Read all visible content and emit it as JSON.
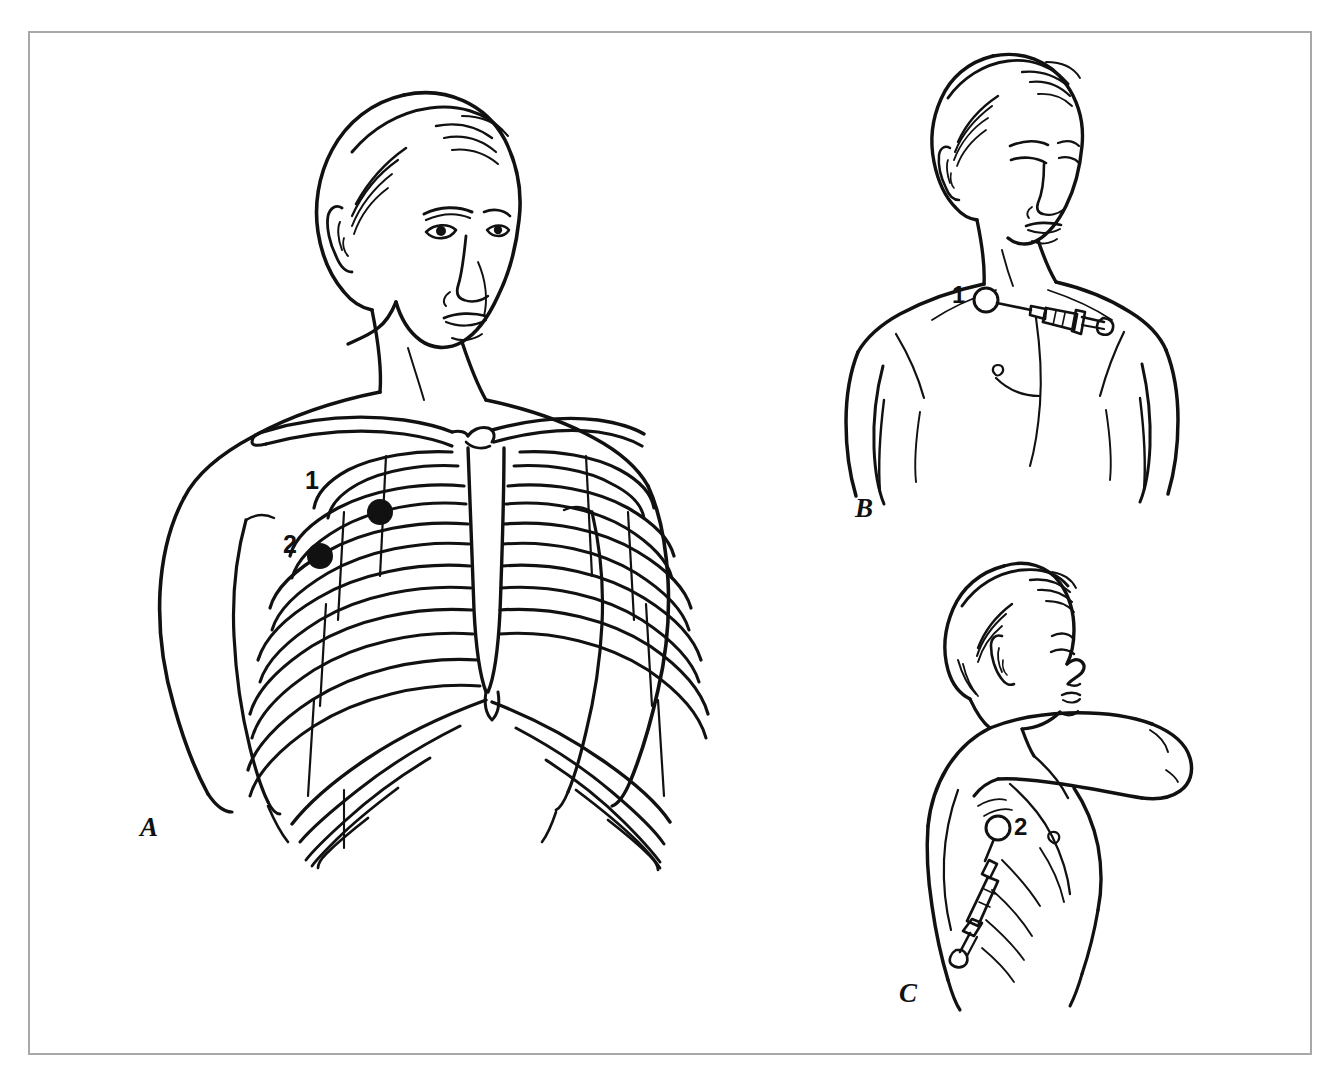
{
  "figure": {
    "background_color": "#ffffff",
    "border_color": "#a8a8a8",
    "ink_color": "#111111"
  },
  "panels": [
    {
      "id": "A",
      "letter": "A",
      "description": "Anterior view of the chest with rib cage, clavicles and sternum shown through the skin; two insertion sites marked with filled black dots on the right anterolateral chest wall.",
      "markers": [
        {
          "label": "1",
          "shape": "filled-dot",
          "description": "Upper insertion site over the anterior chest wall"
        },
        {
          "label": "2",
          "shape": "filled-dot",
          "description": "Lower lateral insertion site"
        }
      ]
    },
    {
      "id": "B",
      "letter": "B",
      "description": "Upper-body front view of the patient with head turned down; a syringe with needle is inserted horizontally at site 1 through a raised skin wheal.",
      "markers": [
        {
          "label": "1",
          "shape": "open-circle-wheal",
          "description": "Skin wheal at anterior needle entry site with syringe attached"
        }
      ]
    },
    {
      "id": "C",
      "letter": "C",
      "description": "Lateral/oblique view of the patient with the arm abducted overhead; a syringe angled downward is inserted at site 2 on the lateral chest wall.",
      "markers": [
        {
          "label": "2",
          "shape": "open-circle-wheal",
          "description": "Skin wheal at lateral needle entry site with syringe angled inferiorly"
        }
      ]
    }
  ],
  "labels": {
    "panel_a_letter": "A",
    "panel_b_letter": "B",
    "panel_c_letter": "C",
    "site_1_panel_a": "1",
    "site_2_panel_a": "2",
    "site_1_panel_b": "1",
    "site_2_panel_c": "2"
  }
}
